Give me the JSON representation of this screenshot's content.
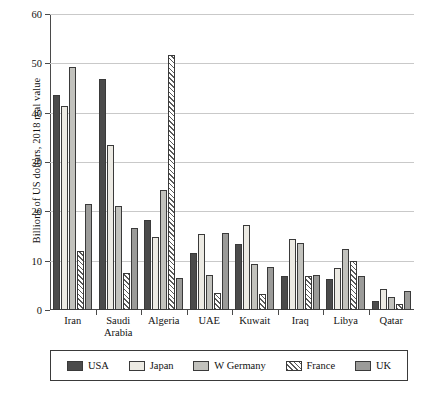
{
  "chart_data": {
    "type": "bar",
    "title": "",
    "xlabel": "",
    "ylabel": "Billions of US dollars, 2018 real value",
    "ylim": [
      0,
      60
    ],
    "yticks": [
      0,
      10,
      20,
      30,
      40,
      50,
      60
    ],
    "ytick_labels": [
      "0",
      "10",
      "20",
      "30",
      "40",
      "50",
      "60"
    ],
    "grid": true,
    "legend_position": "bottom",
    "categories": [
      "Iran",
      "Saudi Arabia",
      "Algeria",
      "UAE",
      "Kuwait",
      "Iraq",
      "Libya",
      "Qatar"
    ],
    "category_lines": [
      [
        "Iran"
      ],
      [
        "Saudi",
        "Arabia"
      ],
      [
        "Algeria"
      ],
      [
        "UAE"
      ],
      [
        "Kuwait"
      ],
      [
        "Iraq"
      ],
      [
        "Libya"
      ],
      [
        "Qatar"
      ]
    ],
    "series": [
      {
        "name": "USA",
        "color": "#4b4b4b",
        "pattern": "solid",
        "values": [
          43.5,
          46.8,
          18.2,
          11.6,
          13.3,
          6.9,
          6.2,
          1.9
        ]
      },
      {
        "name": "Japan",
        "color": "#eceae3",
        "pattern": "solid",
        "values": [
          41.3,
          33.4,
          14.7,
          15.5,
          17.2,
          14.4,
          8.6,
          4.3
        ]
      },
      {
        "name": "W Germany",
        "color": "#c2c2bd",
        "pattern": "solid",
        "values": [
          49.2,
          21.1,
          24.3,
          7.1,
          9.3,
          13.6,
          12.4,
          2.6
        ]
      },
      {
        "name": "France",
        "color": "#ffffff",
        "pattern": "diagonal-hatch",
        "values": [
          12.0,
          7.6,
          51.7,
          3.4,
          3.3,
          6.9,
          10.0,
          1.2
        ]
      },
      {
        "name": "UK",
        "color": "#9b9b99",
        "pattern": "solid",
        "values": [
          21.5,
          16.7,
          6.4,
          15.6,
          8.8,
          7.0,
          6.9,
          3.9
        ]
      }
    ]
  },
  "legend": {
    "items": [
      {
        "label": "USA",
        "swatch": "usa-swatch"
      },
      {
        "label": "Japan",
        "swatch": "japan-swatch"
      },
      {
        "label": "W Germany",
        "swatch": "w-germany-swatch"
      },
      {
        "label": "France",
        "swatch": "france-swatch"
      },
      {
        "label": "UK",
        "swatch": "uk-swatch"
      }
    ]
  }
}
